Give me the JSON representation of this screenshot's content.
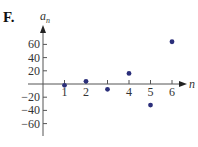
{
  "panel_label": "F.",
  "chart_data": {
    "type": "scatter",
    "title": "",
    "xlabel": "n",
    "ylabel": "a_n",
    "x": [
      1,
      2,
      3,
      4,
      5,
      6
    ],
    "y": [
      -2,
      4,
      -8,
      16,
      -32,
      64
    ],
    "x_ticks": [
      1,
      2,
      3,
      4,
      5,
      6
    ],
    "x_tick_labels": [
      "1",
      "2",
      "",
      "4",
      "5",
      "6"
    ],
    "y_ticks": [
      60,
      40,
      20,
      -20,
      -40,
      -60
    ],
    "y_tick_labels": [
      "60",
      "40",
      "20",
      "−20",
      "−40",
      "−60"
    ],
    "xlim": [
      0,
      6.5
    ],
    "ylim": [
      -80,
      80
    ],
    "grid": false,
    "point_color": "#2b2f7a"
  }
}
